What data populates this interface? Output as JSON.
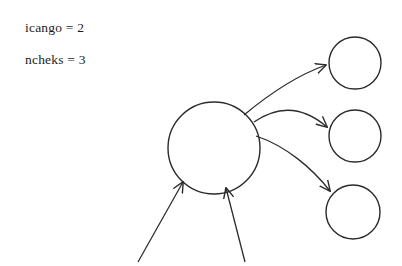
{
  "figure": {
    "background_color": "#ffffff",
    "ink_color": "#2b2b2b",
    "width": 402,
    "height": 266
  },
  "annotations": [
    {
      "id": "icango",
      "text": "icango = 2",
      "x": 25,
      "y": 20
    },
    {
      "id": "ncheks",
      "text": "ncheks = 3",
      "x": 25,
      "y": 52
    }
  ],
  "nodes": [
    {
      "id": "main-node",
      "name": "central-node",
      "label": "",
      "cx": 214,
      "cy": 148,
      "r": 46,
      "stroke": "#2b2b2b",
      "stroke_width": 1.4,
      "fill": "none"
    },
    {
      "id": "target-node-1",
      "name": "target-node-top",
      "label": "",
      "cx": 355,
      "cy": 63,
      "r": 26,
      "stroke": "#2b2b2b",
      "stroke_width": 1.4,
      "fill": "none"
    },
    {
      "id": "target-node-2",
      "name": "target-node-middle",
      "label": "",
      "cx": 355,
      "cy": 136,
      "r": 26,
      "stroke": "#2b2b2b",
      "stroke_width": 1.4,
      "fill": "none"
    },
    {
      "id": "target-node-3",
      "name": "target-node-bottom",
      "label": "",
      "cx": 353,
      "cy": 212,
      "r": 27,
      "stroke": "#2b2b2b",
      "stroke_width": 1.4,
      "fill": "none"
    }
  ],
  "edges": [
    {
      "id": "edge-main-to-top",
      "from": "main-node",
      "to": "target-node-1",
      "kind": "curved-arrow",
      "path": "M 244,115 C 268,95 295,76 326,65",
      "arrowhead": true
    },
    {
      "id": "edge-main-to-middle",
      "from": "main-node",
      "to": "target-node-2",
      "kind": "curved-arrow",
      "path": "M 254,122 C 280,104 305,108 327,127",
      "arrowhead": true
    },
    {
      "id": "edge-main-to-bottom",
      "from": "main-node",
      "to": "target-node-3",
      "kind": "curved-arrow",
      "path": "M 256,136 C 286,146 312,168 330,191",
      "arrowhead": true
    },
    {
      "id": "edge-in-left",
      "to": "main-node",
      "kind": "straight-arrow",
      "path": "M 138,262 L 183,182",
      "arrowhead": true
    },
    {
      "id": "edge-in-right",
      "to": "main-node",
      "kind": "straight-arrow",
      "path": "M 245,262 L 226,188",
      "arrowhead": true
    }
  ]
}
